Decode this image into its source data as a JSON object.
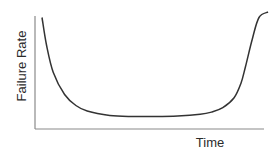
{
  "chart_data": {
    "type": "line",
    "title": "",
    "xlabel": "Time",
    "ylabel": "Failure Rate",
    "grid": false,
    "legend": null,
    "annotations": [],
    "x": [
      0,
      2,
      5,
      10,
      15,
      20,
      30,
      40,
      50,
      60,
      70,
      75,
      80,
      85,
      88,
      90,
      93,
      96,
      100
    ],
    "series": [
      {
        "name": "Failure Rate",
        "values": [
          95,
          70,
          45,
          25,
          15,
          10,
          6,
          5,
          5,
          5.5,
          7,
          9,
          13,
          22,
          35,
          50,
          75,
          95,
          100
        ]
      }
    ],
    "xlim": [
      0,
      100
    ],
    "ylim": [
      0,
      100
    ],
    "x_ticks": [],
    "y_ticks": []
  },
  "colors": {
    "curve": "#333333",
    "axis": "#8a8a8a",
    "text": "#2b2b2b",
    "background": "#ffffff"
  }
}
